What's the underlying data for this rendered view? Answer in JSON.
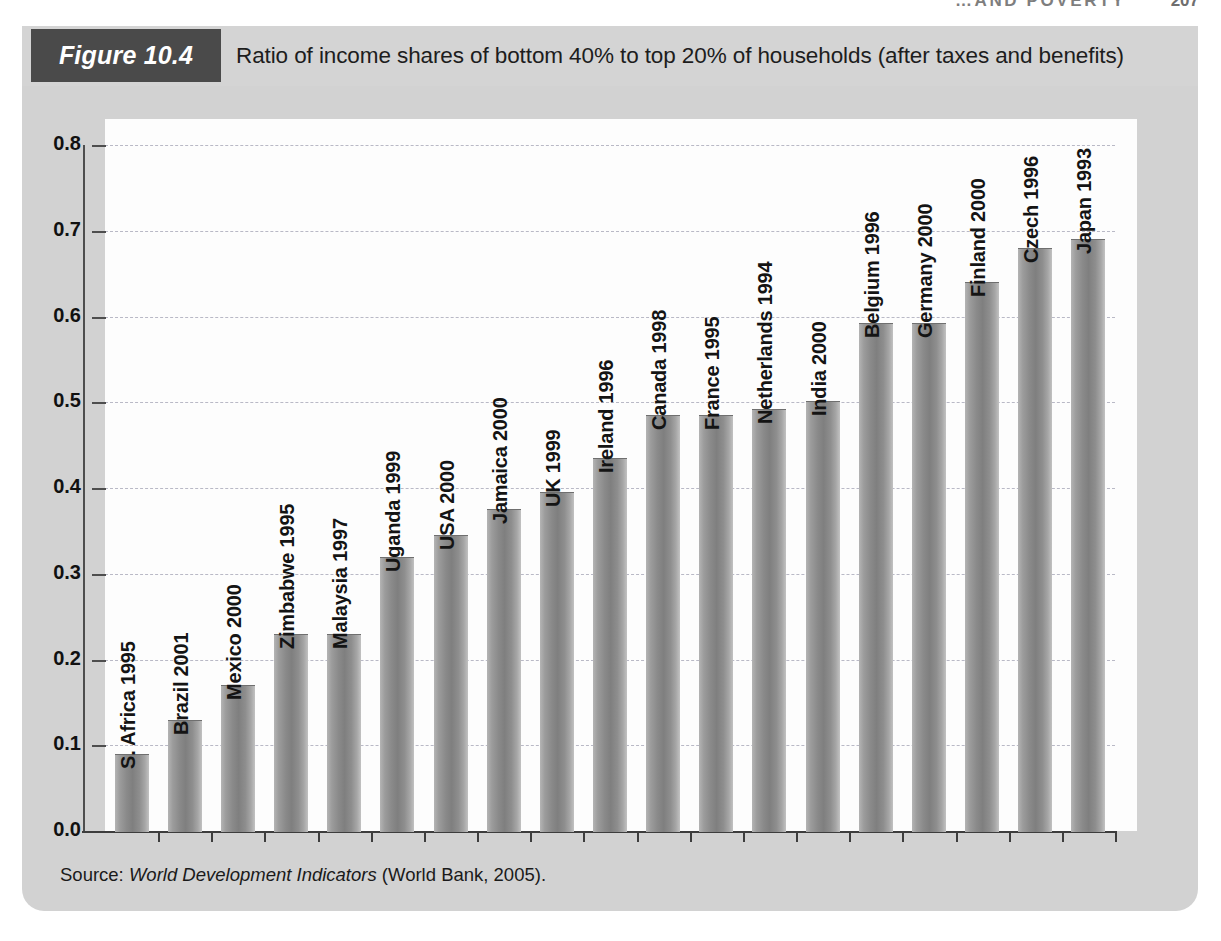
{
  "page": {
    "running_head": "…AND POVERTY",
    "page_number": "207"
  },
  "figure": {
    "tag": "Figure 10.4",
    "caption": "Ratio of income shares of bottom 40% to top 20% of households (after taxes and benefits)",
    "source_prefix": "Source: ",
    "source_italic": "World Development Indicators",
    "source_suffix": " (World Bank, 2005).",
    "tag_bg": "#4a4a4a",
    "panel_bg": "#d2d2d2",
    "plot_bg": "#fdfdfd",
    "bar_color": "#8a8a8a",
    "grid_color": "#b9b9c6"
  },
  "chart_data": {
    "type": "bar",
    "title": "Ratio of income shares of bottom 40% to top 20% of households (after taxes and benefits)",
    "xlabel": "",
    "ylabel": "",
    "ylim": [
      0.0,
      0.8
    ],
    "ytick_labels": [
      "0.8",
      "0.7",
      "0.6",
      "0.5",
      "0.4",
      "0.3",
      "0.2",
      "0.1",
      "0.0"
    ],
    "yticks": [
      0.8,
      0.7,
      0.6,
      0.5,
      0.4,
      0.3,
      0.2,
      0.1,
      0.0
    ],
    "grid": true,
    "legend": "none",
    "categories": [
      "S. Africa 1995",
      "Brazil 2001",
      "Mexico 2000",
      "Zimbabwe 1995",
      "Malaysia 1997",
      "Uganda 1999",
      "USA 2000",
      "Jamaica 2000",
      "UK 1999",
      "Ireland 1996",
      "Canada 1998",
      "France 1995",
      "Netherlands 1994",
      "India 2000",
      "Belgium 1996",
      "Germany 2000",
      "Finland 2000",
      "Czech 1996",
      "Japan 1993"
    ],
    "values": [
      0.09,
      0.13,
      0.17,
      0.23,
      0.23,
      0.32,
      0.345,
      0.375,
      0.395,
      0.435,
      0.485,
      0.485,
      0.492,
      0.502,
      0.592,
      0.592,
      0.64,
      0.68,
      0.69
    ]
  }
}
